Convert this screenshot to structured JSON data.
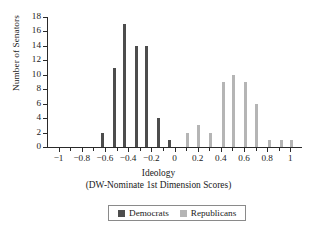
{
  "chart_data": {
    "type": "bar",
    "title": "",
    "subtitle": "",
    "xlabel": "Ideology",
    "xlabel_sub": "(DW-Nominate 1st Dimension Scores)",
    "ylabel": "Number of Senators",
    "xlim": [
      -1.1,
      1.1
    ],
    "ylim": [
      0,
      18
    ],
    "grid": false,
    "legend_position": "bottom-center",
    "x_major_ticks": [
      -1,
      -0.8,
      -0.6,
      -0.4,
      -0.2,
      0,
      0.2,
      0.4,
      0.6,
      0.8,
      1
    ],
    "x_major_tick_labels": [
      "−1",
      "−0.8",
      "−0.6",
      "−0.4",
      "−0.2",
      "0",
      "0.2",
      "0.4",
      "0.6",
      "0.8",
      "1"
    ],
    "x_minor_ticks": [
      -0.9,
      -0.7,
      -0.5,
      -0.3,
      -0.1,
      0.1,
      0.3,
      0.5,
      0.7,
      0.9
    ],
    "y_ticks": [
      0,
      2,
      4,
      6,
      8,
      10,
      12,
      14,
      16,
      18
    ],
    "y_tick_labels": [
      "0",
      "2",
      "4",
      "6",
      "8",
      "10",
      "12",
      "14",
      "16",
      "18"
    ],
    "series": [
      {
        "name": "Democrats",
        "color": "#4d4d4d",
        "points": [
          {
            "x": -0.62,
            "y": 2
          },
          {
            "x": -0.52,
            "y": 11
          },
          {
            "x": -0.43,
            "y": 17
          },
          {
            "x": -0.33,
            "y": 14
          },
          {
            "x": -0.24,
            "y": 14
          },
          {
            "x": -0.14,
            "y": 4
          },
          {
            "x": -0.04,
            "y": 1
          }
        ]
      },
      {
        "name": "Republicans",
        "color": "#b5b5b5",
        "points": [
          {
            "x": 0.11,
            "y": 2
          },
          {
            "x": 0.21,
            "y": 3
          },
          {
            "x": 0.31,
            "y": 2
          },
          {
            "x": 0.42,
            "y": 9
          },
          {
            "x": 0.51,
            "y": 10
          },
          {
            "x": 0.61,
            "y": 9
          },
          {
            "x": 0.71,
            "y": 6
          },
          {
            "x": 0.82,
            "y": 1
          },
          {
            "x": 0.92,
            "y": 1
          },
          {
            "x": 1.01,
            "y": 1
          }
        ]
      }
    ]
  },
  "legend": {
    "items": [
      {
        "label": "Democrats",
        "color": "#4d4d4d"
      },
      {
        "label": "Republicans",
        "color": "#b5b5b5"
      }
    ]
  }
}
